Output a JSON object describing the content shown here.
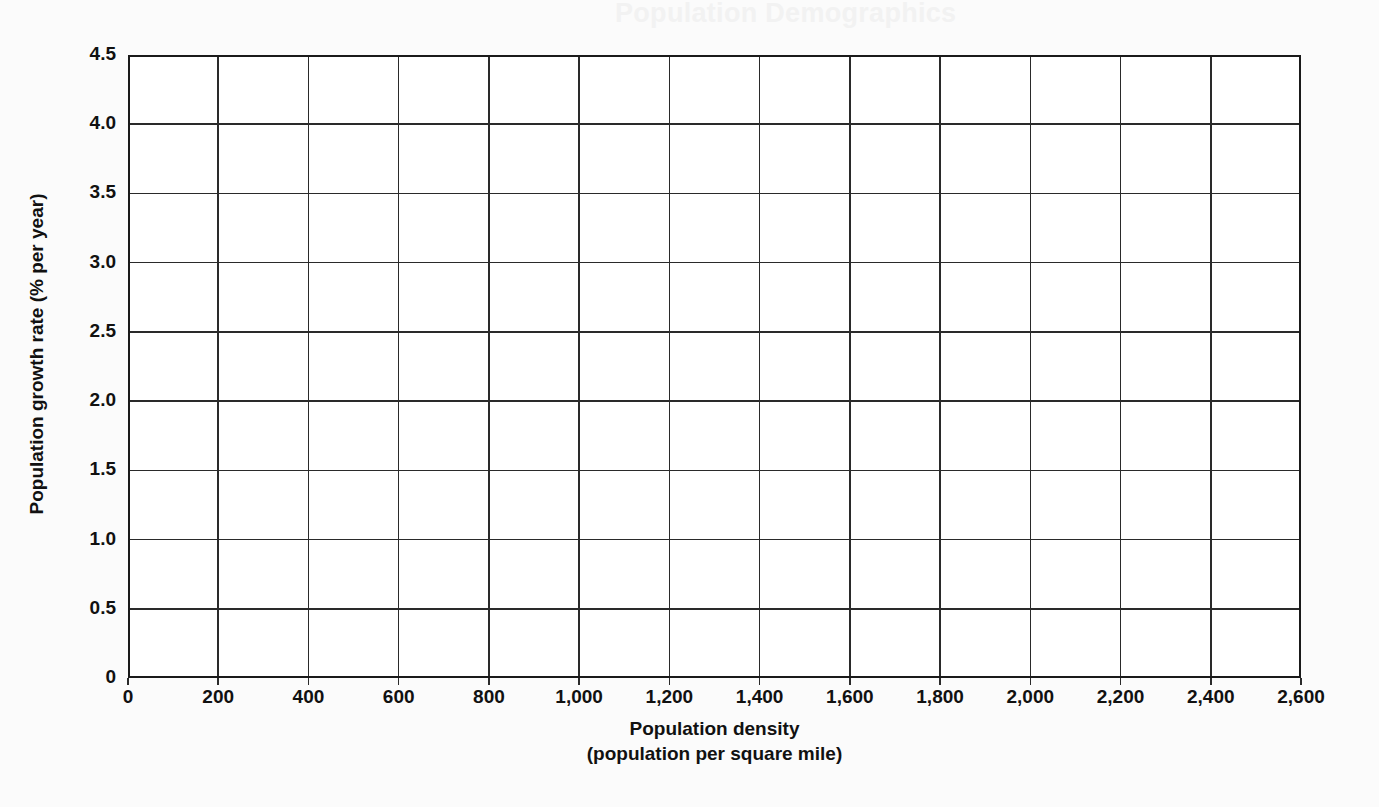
{
  "page": {
    "background_color": "#fbfbfb",
    "ghost_text": {
      "title": "Population Demographics",
      "line1": "Population Density and Growth",
      "line2": "Analysis"
    }
  },
  "chart_data": {
    "type": "scatter",
    "title": "",
    "subtitle": "",
    "xlabel": "Population density",
    "xlabel_sub": "(population per square mile)",
    "ylabel": "Population growth rate (% per year)",
    "xlim": [
      0,
      2600
    ],
    "ylim": [
      0,
      4.5
    ],
    "xticks": [
      0,
      200,
      400,
      600,
      800,
      1000,
      1200,
      1400,
      1600,
      1800,
      2000,
      2200,
      2400,
      2600
    ],
    "xtick_labels": [
      "0",
      "200",
      "400",
      "600",
      "800",
      "1,000",
      "1,200",
      "1,400",
      "1,600",
      "1,800",
      "2,000",
      "2,200",
      "2,400",
      "2,600"
    ],
    "yticks": [
      0,
      0.5,
      1.0,
      1.5,
      2.0,
      2.5,
      3.0,
      3.5,
      4.0,
      4.5
    ],
    "ytick_labels": [
      "0",
      "0.5",
      "1.0",
      "1.5",
      "2.0",
      "2.5",
      "3.0",
      "3.5",
      "4.0",
      "4.5"
    ],
    "grid": true,
    "grid_color": "#2a2a2a",
    "axis_color": "#1a1a1a",
    "legend": null,
    "legend_position": "none",
    "series": [
      {
        "name": "data",
        "x": [],
        "y": []
      }
    ],
    "annotations": [],
    "note": "Empty plotting grid — no data points are drawn on the axes."
  }
}
